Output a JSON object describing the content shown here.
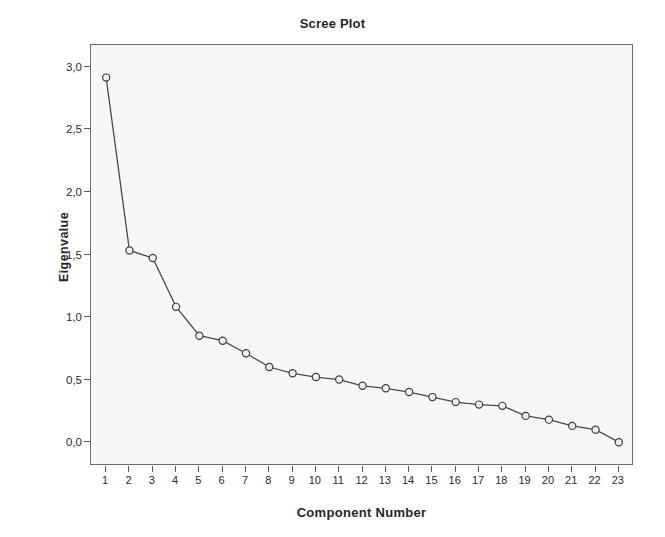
{
  "chart_data": {
    "type": "line",
    "title": "Scree Plot",
    "xlabel": "Component Number",
    "ylabel": "Eigenvalue",
    "x": [
      1,
      2,
      3,
      4,
      5,
      6,
      7,
      8,
      9,
      10,
      11,
      12,
      13,
      14,
      15,
      16,
      17,
      18,
      19,
      20,
      21,
      22,
      23
    ],
    "values": [
      2.92,
      1.54,
      1.48,
      1.09,
      0.86,
      0.82,
      0.72,
      0.61,
      0.56,
      0.53,
      0.51,
      0.46,
      0.44,
      0.41,
      0.37,
      0.33,
      0.31,
      0.3,
      0.22,
      0.19,
      0.14,
      0.11,
      0.01
    ],
    "categories": [
      "1",
      "2",
      "3",
      "4",
      "5",
      "6",
      "7",
      "8",
      "9",
      "10",
      "11",
      "12",
      "13",
      "14",
      "15",
      "16",
      "17",
      "18",
      "19",
      "20",
      "21",
      "22",
      "23"
    ],
    "xtick_labels": [
      "1",
      "2",
      "3",
      "4",
      "5",
      "6",
      "7",
      "8",
      "9",
      "10",
      "11",
      "12",
      "13",
      "14",
      "15",
      "16",
      "17",
      "18",
      "19",
      "20",
      "21",
      "22",
      "23"
    ],
    "ytick_labels": [
      "3,0",
      "2,5",
      "2,0",
      "1,5",
      "1,0",
      "0,5",
      "0,0"
    ],
    "ytick_values": [
      3.0,
      2.5,
      2.0,
      1.5,
      1.0,
      0.5,
      0.0
    ],
    "ylim": [
      -0.18,
      3.18
    ],
    "xlim": [
      0.35,
      23.65
    ],
    "grid": false,
    "legend": "none",
    "decimal_separator": ",",
    "series_name": "Eigenvalue",
    "marker": "open-circle",
    "line_color": "#4a4a4a",
    "marker_fill": "#f2f2f2",
    "marker_stroke": "#3d3d3d",
    "plot_background": "#f7f7f7",
    "frame_color": "#6b6b6b",
    "text_color": "#262626"
  }
}
